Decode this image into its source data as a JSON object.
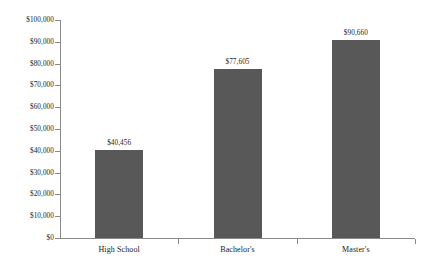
{
  "chart_data": {
    "type": "bar",
    "title": "",
    "subtitle": "",
    "xlabel": "",
    "ylabel": "",
    "categories": [
      "High School",
      "Bachelor's",
      "Master's"
    ],
    "values": [
      40456,
      77605,
      90660
    ],
    "value_labels": [
      "$40,456",
      "$77,605",
      "$90,660"
    ],
    "ylim": [
      0,
      100000
    ],
    "ytick_values": [
      0,
      10000,
      20000,
      30000,
      40000,
      50000,
      60000,
      70000,
      80000,
      90000,
      100000
    ],
    "ytick_labels": [
      "$0",
      "$10,000",
      "$20,000",
      "$30,000",
      "$40,000",
      "$50,000",
      "$60,000",
      "$70,000",
      "$80,000",
      "$90,000",
      "$100,000"
    ],
    "grid": false,
    "legend": false,
    "legend_position": "none",
    "bar_color": "#585858",
    "axis_color": "#8a8a8a",
    "text_color": "#1a1a1a",
    "background_color": "#ffffff"
  }
}
